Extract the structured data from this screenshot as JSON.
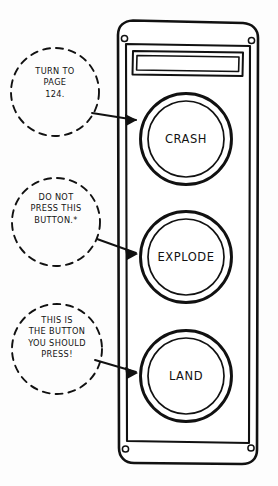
{
  "illustration": {
    "title": "Spaceship control panel with three buttons and three annotation callouts",
    "style": "hand-drawn black ink line art",
    "ink_color": "#111111",
    "paper_color": "#fdfdfd"
  },
  "device": {
    "name": "control-panel",
    "screw_holes": 4,
    "display": {
      "name": "display-screen",
      "content": ""
    }
  },
  "buttons": [
    {
      "label": "CRASH",
      "icon": "round-button-icon"
    },
    {
      "label": "EXPLODE",
      "icon": "round-button-icon"
    },
    {
      "label": "LAND",
      "icon": "round-button-icon"
    }
  ],
  "callouts": [
    {
      "text": "TURN TO\nPAGE\n124.",
      "target": "CRASH",
      "arrow": "arrow-right-icon"
    },
    {
      "text": "DO NOT\nPRESS THIS\nBUTTON.*",
      "target": "EXPLODE",
      "arrow": "arrow-right-icon"
    },
    {
      "text": "THIS IS\nTHE BUTTON\nYOU SHOULD\nPRESS!",
      "target": "LAND",
      "arrow": "arrow-right-icon"
    }
  ]
}
